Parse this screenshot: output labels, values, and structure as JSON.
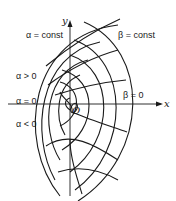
{
  "diagram": {
    "axes": {
      "x_label": "x",
      "y_label": "y",
      "origin_label": "O"
    },
    "labels": {
      "alpha_const": "α = const",
      "beta_const": "β = const",
      "alpha_pos": "α > 0",
      "alpha_zero": "α = 0",
      "alpha_neg": "α < 0",
      "beta_zero": "β = 0"
    },
    "families": [
      {
        "name": "alpha-const-curves",
        "description": "nested arcs opening to the left, centered near the origin"
      },
      {
        "name": "beta-const-curves",
        "description": "radiating curves crossing the arcs, symmetric about the x-axis"
      }
    ]
  }
}
